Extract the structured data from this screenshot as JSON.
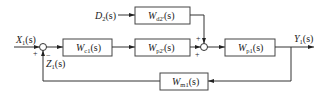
{
  "diagram": {
    "type": "control-system-block-diagram",
    "inputs": {
      "x1": {
        "main": "X",
        "sub": "1",
        "tail": "(s)"
      },
      "d2": {
        "main": "D",
        "sub": "2",
        "tail": "(s)"
      }
    },
    "outputs": {
      "y1": {
        "main": "Y",
        "sub": "1",
        "tail": "(s)"
      }
    },
    "feedback_signal": {
      "main": "Z",
      "sub": "1",
      "tail": "(s)"
    },
    "blocks": {
      "wc1": {
        "main": "W",
        "sub": "c1",
        "tail": "(s)"
      },
      "wp2": {
        "main": "W",
        "sub": "p2'",
        "tail": "(s)"
      },
      "wd2": {
        "main": "W",
        "sub": "d2'",
        "tail": "(s)"
      },
      "wp1": {
        "main": "W",
        "sub": "p1",
        "tail": "(s)"
      },
      "wm1": {
        "main": "W",
        "sub": "m1",
        "tail": "(s)"
      }
    },
    "summing_junctions": {
      "sum1": {
        "plus": "+",
        "minus": "−"
      },
      "sum2": {
        "plus_top": "+",
        "plus_left": "+"
      }
    }
  }
}
